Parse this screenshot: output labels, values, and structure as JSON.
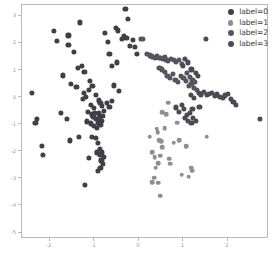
{
  "figure": {
    "background_color": "#ffffff",
    "frame_color": "#b9b9b9",
    "tick_label_color": "#9a9a9a",
    "legend_text_color": "#3a3a3a"
  },
  "legend": {
    "position": "upper-right",
    "entries": [
      {
        "label": "label=0",
        "color": "#3f3f46",
        "size": 3.1
      },
      {
        "label": "label=1",
        "color": "#8e8e96",
        "size": 2.7
      },
      {
        "label": "label=2",
        "color": "#55555e",
        "size": 3.0
      },
      {
        "label": "label=3",
        "color": "#4a4a53",
        "size": 3.0
      }
    ]
  },
  "chart_data": {
    "type": "scatter",
    "title": "",
    "xlabel": "",
    "ylabel": "",
    "grid": false,
    "legend_position": "upper right",
    "xlim": [
      -2.62,
      2.92
    ],
    "ylim": [
      -5.22,
      3.42
    ],
    "xticks": [
      -2,
      -1,
      0,
      1,
      2
    ],
    "xtick_labels": [
      "-2",
      "-1",
      "0",
      "1",
      "2"
    ],
    "yticks": [
      3,
      2,
      1,
      0,
      -1,
      -2,
      -3,
      -4,
      -5
    ],
    "ytick_labels": [
      "3",
      "2",
      "1",
      "0",
      "-1",
      "-2",
      "-3",
      "-4",
      "-5"
    ],
    "series": [
      {
        "name": "label=0",
        "color": "#3f3f46",
        "marker_size": 2.6,
        "points": [
          [
            -1.9,
            2.45
          ],
          [
            -1.84,
            2.1
          ],
          [
            -1.58,
            2.3
          ],
          [
            -1.32,
            2.78
          ],
          [
            -1.45,
            1.68
          ],
          [
            -1.36,
            1.1
          ],
          [
            -1.7,
            0.82
          ],
          [
            -1.52,
            0.52
          ],
          [
            -1.4,
            0.4
          ],
          [
            -1.28,
            1.18
          ],
          [
            -1.22,
            0.95
          ],
          [
            -1.24,
            0.18
          ],
          [
            -1.18,
            0.02
          ],
          [
            -1.12,
            0.3
          ],
          [
            -1.08,
            -0.28
          ],
          [
            -1.14,
            -0.52
          ],
          [
            -1.05,
            -0.62
          ],
          [
            -1.0,
            -0.38
          ],
          [
            -0.98,
            -0.55
          ],
          [
            -1.02,
            -0.72
          ],
          [
            -0.95,
            -0.8
          ],
          [
            -0.9,
            -0.58
          ],
          [
            -0.88,
            -0.72
          ],
          [
            -0.92,
            -0.92
          ],
          [
            -0.86,
            -1.02
          ],
          [
            -0.94,
            -1.12
          ],
          [
            -1.0,
            -1.05
          ],
          [
            -0.84,
            -0.85
          ],
          [
            -0.8,
            -0.66
          ],
          [
            -0.78,
            -0.48
          ],
          [
            -0.82,
            -0.32
          ],
          [
            -0.86,
            -0.2
          ],
          [
            -0.9,
            -0.1
          ],
          [
            -0.96,
            0.1
          ],
          [
            -1.04,
            0.44
          ],
          [
            -1.1,
            0.62
          ],
          [
            -0.72,
            -0.18
          ],
          [
            -0.66,
            -0.34
          ],
          [
            -0.6,
            -0.12
          ],
          [
            -1.06,
            -1.46
          ],
          [
            -0.96,
            -1.5
          ],
          [
            -0.92,
            -1.68
          ],
          [
            -0.88,
            -1.88
          ],
          [
            -0.94,
            -2.02
          ],
          [
            -0.88,
            -2.12
          ],
          [
            -0.82,
            -2.02
          ],
          [
            -0.78,
            -2.18
          ],
          [
            -0.84,
            -2.32
          ],
          [
            -0.8,
            -2.46
          ],
          [
            -0.86,
            -2.58
          ],
          [
            -0.92,
            -2.7
          ],
          [
            -1.12,
            -2.22
          ],
          [
            -1.2,
            -3.22
          ],
          [
            -2.32,
            -0.92
          ],
          [
            -2.4,
            0.18
          ],
          [
            -2.28,
            -0.78
          ],
          [
            -2.18,
            -1.78
          ],
          [
            -2.16,
            -2.12
          ],
          [
            -1.74,
            -0.56
          ],
          [
            -1.62,
            -0.8
          ],
          [
            -1.54,
            -1.58
          ],
          [
            -1.34,
            -1.46
          ],
          [
            -1.58,
            1.96
          ],
          [
            -0.76,
            2.4
          ],
          [
            -0.7,
            2.05
          ],
          [
            -0.66,
            1.62
          ],
          [
            -0.6,
            1.18
          ],
          [
            -0.56,
            0.45
          ],
          [
            -0.5,
            1.3
          ],
          [
            -0.44,
            0.26
          ],
          [
            -0.38,
            2.18
          ],
          [
            -0.34,
            2.28
          ],
          [
            -0.3,
            3.28
          ],
          [
            -0.24,
            2.9
          ],
          [
            -0.28,
            2.22
          ],
          [
            -0.2,
            1.92
          ],
          [
            -0.14,
            2.12
          ],
          [
            -0.08,
            1.88
          ],
          [
            -0.04,
            1.62
          ],
          [
            -0.46,
            2.48
          ],
          [
            -0.52,
            2.58
          ],
          [
            -1.26,
            -0.05
          ],
          [
            -1.16,
            -0.88
          ],
          [
            -1.08,
            -0.95
          ]
        ]
      },
      {
        "name": "label=1",
        "color": "#8e8e96",
        "marker_size": 2.3,
        "points": [
          [
            0.24,
            -1.44
          ],
          [
            0.3,
            -2.02
          ],
          [
            0.36,
            -2.2
          ],
          [
            0.4,
            -1.14
          ],
          [
            0.42,
            -1.28
          ],
          [
            0.46,
            -1.58
          ],
          [
            0.5,
            -1.6
          ],
          [
            0.52,
            -1.84
          ],
          [
            0.48,
            -2.14
          ],
          [
            0.44,
            -2.42
          ],
          [
            0.38,
            -2.58
          ],
          [
            0.34,
            -2.96
          ],
          [
            0.3,
            -3.12
          ],
          [
            0.44,
            -3.14
          ],
          [
            0.48,
            -3.62
          ],
          [
            0.42,
            -5.42
          ],
          [
            0.5,
            -5.36
          ],
          [
            0.68,
            -2.26
          ],
          [
            0.7,
            -2.44
          ],
          [
            0.58,
            -1.12
          ],
          [
            0.62,
            -0.62
          ],
          [
            0.66,
            -0.18
          ],
          [
            0.9,
            -1.58
          ],
          [
            0.96,
            -2.84
          ],
          [
            1.12,
            -2.92
          ],
          [
            1.06,
            -1.8
          ],
          [
            1.18,
            -2.58
          ],
          [
            1.2,
            -2.7
          ],
          [
            1.52,
            -1.44
          ],
          [
            0.52,
            -0.54
          ],
          [
            0.78,
            -1.66
          ],
          [
            0.86,
            -0.92
          ]
        ]
      },
      {
        "name": "label=2",
        "color": "#55555e",
        "marker_size": 2.6,
        "points": [
          [
            0.04,
            2.16
          ],
          [
            0.1,
            2.16
          ],
          [
            0.18,
            1.62
          ],
          [
            0.24,
            1.56
          ],
          [
            0.3,
            1.52
          ],
          [
            0.36,
            1.48
          ],
          [
            0.4,
            1.52
          ],
          [
            0.46,
            1.48
          ],
          [
            0.5,
            1.46
          ],
          [
            0.54,
            1.42
          ],
          [
            0.58,
            1.5
          ],
          [
            0.62,
            1.4
          ],
          [
            0.66,
            1.36
          ],
          [
            0.72,
            1.44
          ],
          [
            0.78,
            1.38
          ],
          [
            0.84,
            1.32
          ],
          [
            0.9,
            1.38
          ],
          [
            0.96,
            1.26
          ],
          [
            0.58,
            0.96
          ],
          [
            0.64,
            0.8
          ],
          [
            0.7,
            0.72
          ],
          [
            0.76,
            0.88
          ],
          [
            0.82,
            0.64
          ],
          [
            0.88,
            0.58
          ],
          [
            0.94,
            0.8
          ],
          [
            1.0,
            0.72
          ],
          [
            1.06,
            0.62
          ],
          [
            1.12,
            0.44
          ],
          [
            1.18,
            0.52
          ],
          [
            1.24,
            0.36
          ],
          [
            1.3,
            0.3
          ],
          [
            1.08,
            0.9
          ],
          [
            1.14,
            0.76
          ],
          [
            1.2,
            0.66
          ],
          [
            1.26,
            0.58
          ],
          [
            0.52,
            1.04
          ],
          [
            0.46,
            1.1
          ]
        ]
      },
      {
        "name": "label=3",
        "color": "#4a4a53",
        "marker_size": 2.6,
        "points": [
          [
            1.34,
            0.18
          ],
          [
            1.4,
            0.12
          ],
          [
            1.46,
            0.2
          ],
          [
            1.52,
            0.1
          ],
          [
            1.58,
            0.14
          ],
          [
            1.64,
            0.16
          ],
          [
            1.7,
            0.06
          ],
          [
            1.76,
            0.12
          ],
          [
            1.82,
            0.04
          ],
          [
            1.88,
            -0.02
          ],
          [
            1.94,
            0.08
          ],
          [
            2.0,
            0.14
          ],
          [
            2.06,
            -0.06
          ],
          [
            2.12,
            -0.16
          ],
          [
            2.18,
            -0.28
          ],
          [
            1.5,
            2.18
          ],
          [
            1.28,
            0.92
          ],
          [
            1.32,
            0.8
          ],
          [
            1.36,
            -0.34
          ],
          [
            1.2,
            -0.42
          ],
          [
            1.14,
            -0.56
          ],
          [
            1.08,
            -0.64
          ],
          [
            1.02,
            -0.42
          ],
          [
            0.96,
            -0.28
          ],
          [
            1.22,
            -0.76
          ],
          [
            1.28,
            -0.86
          ],
          [
            1.18,
            -0.94
          ],
          [
            1.1,
            -0.86
          ],
          [
            1.04,
            -0.74
          ],
          [
            2.72,
            -0.78
          ],
          [
            1.04,
            1.42
          ],
          [
            1.1,
            1.3
          ],
          [
            0.98,
            1.18
          ],
          [
            1.18,
            1.04
          ],
          [
            0.9,
            -0.54
          ],
          [
            0.84,
            -0.36
          ],
          [
            1.16,
            0.1
          ],
          [
            1.24,
            0.0
          ]
        ]
      }
    ]
  }
}
